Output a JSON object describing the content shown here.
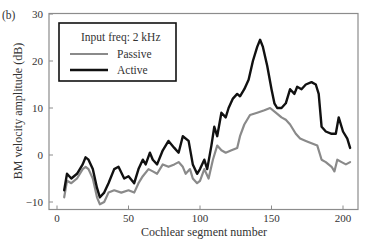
{
  "panel_label": "(b)",
  "chart_data": {
    "type": "line",
    "title": "",
    "xlabel": "Cochlear segment number",
    "ylabel": "BM velocity amplitude (dB)",
    "xlim": [
      -3,
      212
    ],
    "ylim": [
      -12,
      30
    ],
    "xticks": [
      0,
      50,
      100,
      150,
      200
    ],
    "yticks": [
      -10,
      0,
      10,
      20,
      30
    ],
    "xtick_labels": [
      "0",
      "50",
      "100",
      "150",
      "200"
    ],
    "ytick_labels": [
      "−10",
      "0",
      "10",
      "20",
      "30"
    ],
    "grid": false,
    "legend": {
      "position": "upper left",
      "title": "Input freq: 2 kHz",
      "entries": [
        "Passive",
        "Active"
      ]
    },
    "series": [
      {
        "name": "Passive",
        "color": "#8a8a8a",
        "width": 2.2,
        "x": [
          5,
          7,
          10,
          14,
          18,
          20,
          22,
          25,
          28,
          30,
          33,
          36,
          40,
          45,
          50,
          54,
          57,
          60,
          64,
          67,
          70,
          74,
          78,
          82,
          85,
          88,
          90,
          93,
          95,
          98,
          100,
          103,
          106,
          109,
          112,
          115,
          118,
          122,
          126,
          128,
          131,
          135,
          140,
          145,
          149,
          153,
          157,
          160,
          163,
          167,
          170,
          174,
          178,
          182,
          185,
          188,
          192,
          194,
          196,
          199,
          202,
          205
        ],
        "y": [
          -9,
          -5.5,
          -6,
          -5,
          -3,
          -2.5,
          -3,
          -5,
          -9,
          -10.5,
          -10,
          -8,
          -7.5,
          -8,
          -7.5,
          -8,
          -6,
          -4.5,
          -3,
          -3.5,
          -4,
          -2,
          -2.5,
          -2,
          -1.5,
          -2.5,
          -4,
          -3,
          -5,
          -6,
          -5.5,
          -3,
          -5,
          -1,
          2,
          1,
          0.5,
          1,
          1.5,
          4,
          6.5,
          8.5,
          9,
          9.5,
          10,
          9,
          8,
          7.5,
          6.5,
          4.5,
          3.5,
          3,
          2.5,
          2,
          -1,
          -1.5,
          -2.5,
          -3.5,
          -1,
          -1.5,
          -2,
          -1.5
        ]
      },
      {
        "name": "Active",
        "color": "#111111",
        "width": 2.4,
        "x": [
          5,
          7,
          10,
          14,
          18,
          20,
          22,
          25,
          28,
          30,
          33,
          36,
          40,
          43,
          47,
          50,
          54,
          57,
          60,
          62,
          65,
          67,
          70,
          74,
          78,
          82,
          85,
          88,
          92,
          95,
          98,
          100,
          103,
          105,
          108,
          110,
          112,
          115,
          118,
          120,
          123,
          126,
          128,
          131,
          134,
          137,
          140,
          142,
          144,
          147,
          150,
          152,
          154,
          157,
          160,
          163,
          166,
          168,
          171,
          174,
          178,
          181,
          183,
          185,
          188,
          192,
          195,
          197,
          200,
          203,
          205
        ],
        "y": [
          -7.5,
          -4,
          -5,
          -4,
          -2,
          -0.5,
          -1,
          -3,
          -7,
          -9,
          -8,
          -6,
          -3,
          -2.5,
          -5,
          -4.5,
          -6,
          -3,
          -1,
          -2,
          0.5,
          -1,
          -2,
          1,
          3,
          1.5,
          0.5,
          4,
          3,
          -2,
          -4,
          -3,
          -1,
          -3,
          2,
          6,
          4,
          9,
          8,
          10,
          12,
          13,
          12.5,
          14,
          16,
          20,
          23,
          24.5,
          23,
          19,
          14,
          11,
          10,
          10,
          11,
          14,
          13,
          14.5,
          14,
          15,
          15.5,
          15,
          13,
          6,
          5,
          4.5,
          4.5,
          8,
          5,
          3.5,
          1.5
        ]
      }
    ]
  }
}
